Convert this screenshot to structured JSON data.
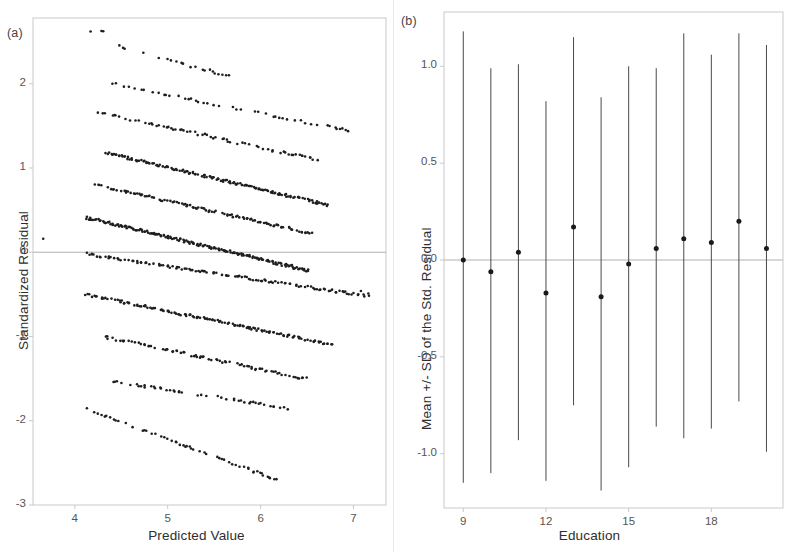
{
  "figure": {
    "background": "#ffffff",
    "ink": "#2b2b2b",
    "frame_color": "#c9c9c9",
    "refline_color": "#b0b0b0"
  },
  "panels": [
    {
      "letter": "(a)",
      "name": "residual-vs-fitted"
    },
    {
      "letter": "(b)",
      "name": "residual-by-education"
    }
  ],
  "chart_data": [
    {
      "type": "scatter",
      "panel": "(a)",
      "title": "",
      "xlabel": "Predicted Value",
      "ylabel": "Standardized Residual",
      "xlim": [
        3.55,
        7.35
      ],
      "ylim": [
        -3.0,
        2.78
      ],
      "xticks": [
        4,
        5,
        6,
        7
      ],
      "xtick_labels": [
        "4",
        "5",
        "6",
        "7"
      ],
      "yticks": [
        2,
        1,
        0,
        -1,
        -2,
        -3
      ],
      "ytick_labels": [
        "2",
        "1",
        "0",
        "-1",
        "-2",
        "-3"
      ],
      "grid": false,
      "legend": "none",
      "reference_line_y": 0,
      "marker_color": "#1e1e1e",
      "marker_size_px": 2.6,
      "description": "Parallel descending diagonal bands typical of a discrete integer outcome; each band is one observed outcome level.",
      "bands": [
        {
          "level": 12,
          "x_start": 4.28,
          "y_start": 2.62,
          "x_end": 4.3,
          "y_end": 2.62,
          "density": 0.1,
          "n": 4
        },
        {
          "level": 11,
          "x_start": 4.47,
          "y_start": 2.44,
          "x_end": 5.7,
          "y_end": 2.08,
          "density": 0.32,
          "n": 34
        },
        {
          "level": 10,
          "x_start": 4.4,
          "y_start": 2.0,
          "x_end": 6.95,
          "y_end": 1.44,
          "density": 0.45,
          "n": 66
        },
        {
          "level": 9,
          "x_start": 4.26,
          "y_start": 1.66,
          "x_end": 6.6,
          "y_end": 1.1,
          "density": 0.6,
          "n": 88
        },
        {
          "level": 8,
          "x_start": 4.34,
          "y_start": 1.18,
          "x_end": 6.72,
          "y_end": 0.56,
          "density": 0.92,
          "n": 150
        },
        {
          "level": 7,
          "x_start": 4.23,
          "y_start": 0.8,
          "x_end": 6.55,
          "y_end": 0.22,
          "density": 0.75,
          "n": 120
        },
        {
          "level": 6,
          "x_start": 4.13,
          "y_start": 0.41,
          "x_end": 6.52,
          "y_end": -0.22,
          "density": 1.0,
          "n": 180
        },
        {
          "level": 5,
          "x_start": 4.12,
          "y_start": -0.02,
          "x_end": 7.15,
          "y_end": -0.52,
          "density": 0.8,
          "n": 130
        },
        {
          "level": 4,
          "x_start": 4.12,
          "y_start": -0.5,
          "x_end": 6.78,
          "y_end": -1.1,
          "density": 0.88,
          "n": 145
        },
        {
          "level": 3,
          "x_start": 4.3,
          "y_start": -1.0,
          "x_end": 6.48,
          "y_end": -1.5,
          "density": 0.7,
          "n": 110
        },
        {
          "level": 2,
          "x_start": 4.4,
          "y_start": -1.53,
          "x_end": 6.35,
          "y_end": -1.86,
          "density": 0.5,
          "n": 70
        },
        {
          "level": 1,
          "x_start": 4.12,
          "y_start": -1.86,
          "x_end": 6.22,
          "y_end": -2.72,
          "density": 0.55,
          "n": 82
        }
      ],
      "stray_points": [
        {
          "x": 3.66,
          "y": 0.16
        },
        {
          "x": 4.17,
          "y": 2.62
        },
        {
          "x": 6.88,
          "y": 1.47
        },
        {
          "x": 7.08,
          "y": -0.46
        },
        {
          "x": 7.16,
          "y": -0.49
        }
      ]
    },
    {
      "type": "scatter",
      "panel": "(b)",
      "title": "",
      "xlabel": "Education",
      "ylabel": "Mean +/- SD of the Std. Residual",
      "xlim": [
        8.3,
        20.6
      ],
      "ylim": [
        -1.28,
        1.28
      ],
      "xticks": [
        9,
        12,
        15,
        18
      ],
      "xtick_labels": [
        "9",
        "12",
        "15",
        "18"
      ],
      "yticks": [
        1.0,
        0.5,
        0.0,
        -0.5,
        -1.0
      ],
      "ytick_labels": [
        "1.0",
        "0.5",
        "0.0",
        "-0.5",
        "-1.0"
      ],
      "grid": false,
      "legend": "none",
      "reference_line_y": 0,
      "marker_color": "#1a1a1a",
      "marker_size_px": 5.0,
      "errorbar_color": "#4a4a4a",
      "categories": [
        9,
        10,
        11,
        12,
        13,
        14,
        15,
        16,
        17,
        18,
        19,
        20
      ],
      "means": [
        0.0,
        -0.06,
        0.04,
        -0.17,
        0.17,
        -0.19,
        -0.02,
        0.06,
        0.11,
        0.09,
        0.2,
        0.06
      ],
      "upper": [
        1.18,
        0.99,
        1.01,
        0.82,
        1.15,
        0.84,
        1.0,
        0.99,
        1.17,
        1.06,
        1.17,
        1.11
      ],
      "lower": [
        -1.15,
        -1.1,
        -0.93,
        -1.14,
        -0.75,
        -1.19,
        -1.07,
        -0.86,
        -0.92,
        -0.87,
        -0.73,
        -0.99
      ]
    }
  ]
}
